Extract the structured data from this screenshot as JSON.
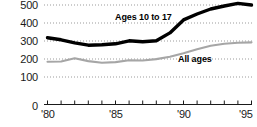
{
  "chart_data": {
    "type": "line",
    "title": "",
    "xlabel": "",
    "ylabel": "",
    "xlim": [
      1980,
      1995
    ],
    "ylim": [
      0,
      500
    ],
    "grid": true,
    "legend_position": "inline-annotation",
    "y_ticks": [
      "0",
      "100",
      "200",
      "300",
      "400",
      "500"
    ],
    "y_tick_values": [
      0,
      100,
      200,
      300,
      400,
      500
    ],
    "x_ticks": [
      "'80",
      "'85",
      "'90",
      "'95"
    ],
    "x_tick_values": [
      1980,
      1985,
      1990,
      1995
    ],
    "x": [
      1980,
      1981,
      1982,
      1983,
      1984,
      1985,
      1986,
      1987,
      1988,
      1989,
      1990,
      1991,
      1992,
      1993,
      1994,
      1995
    ],
    "series": [
      {
        "name": "Ages 10 to 17",
        "color": "#000000",
        "values": [
          335,
          325,
          310,
          298,
          300,
          305,
          320,
          315,
          320,
          360,
          425,
          455,
          480,
          495,
          508,
          500
        ]
      },
      {
        "name": "All ages",
        "color": "#a6a6a6",
        "values": [
          215,
          216,
          232,
          218,
          210,
          213,
          222,
          221,
          228,
          240,
          258,
          278,
          295,
          305,
          310,
          312
        ]
      }
    ],
    "annotations": [
      {
        "text": "Ages 10 to 17",
        "series": "Ages 10 to 17"
      },
      {
        "text": "All ages",
        "series": "All ages"
      }
    ]
  },
  "colors": {
    "axis": "#1a1a1a",
    "gridline": "#9b9b9b",
    "background": "#ffffff",
    "bold_series": "#000000",
    "light_series": "#a6a6a6"
  }
}
